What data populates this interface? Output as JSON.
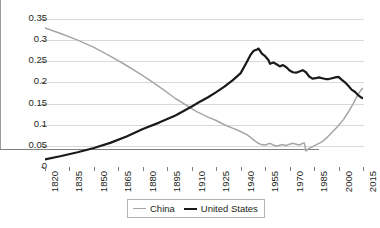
{
  "chart_data": {
    "type": "line",
    "title": "",
    "subtitle": "",
    "xlabel": "",
    "ylabel": "",
    "xlim": [
      1820,
      2015
    ],
    "ylim": [
      0,
      0.35
    ],
    "grid": true,
    "legend_position": "bottom",
    "ytick_labels": [
      "0.35",
      "0.3",
      "0.25",
      "0.2",
      "0.15",
      "0.1",
      "0.05",
      "0"
    ],
    "ytick_values": [
      0.35,
      0.3,
      0.25,
      0.2,
      0.15,
      0.1,
      0.05,
      0
    ],
    "xtick_labels": [
      "1820",
      "1835",
      "1850",
      "1865",
      "1880",
      "1895",
      "1910",
      "1925",
      "1940",
      "1955",
      "1970",
      "1985",
      "2000",
      "2015"
    ],
    "xtick_values": [
      1820,
      1835,
      1850,
      1865,
      1880,
      1895,
      1910,
      1925,
      1940,
      1955,
      1970,
      1985,
      2000,
      2015
    ],
    "series": [
      {
        "name": "China",
        "color": "#a6a6a6",
        "x": [
          1820,
          1830,
          1840,
          1850,
          1860,
          1870,
          1880,
          1890,
          1900,
          1910,
          1913,
          1920,
          1925,
          1930,
          1935,
          1940,
          1944,
          1946,
          1948,
          1950,
          1952,
          1955,
          1958,
          1960,
          1962,
          1965,
          1968,
          1970,
          1972,
          1974,
          1976,
          1978,
          1979,
          1980,
          1982,
          1985,
          1988,
          1990,
          1993,
          1995,
          1998,
          2000,
          2003,
          2006,
          2009,
          2012,
          2014,
          2016
        ],
        "y": [
          0.329,
          0.315,
          0.3,
          0.283,
          0.262,
          0.24,
          0.216,
          0.19,
          0.162,
          0.138,
          0.131,
          0.118,
          0.11,
          0.1,
          0.092,
          0.084,
          0.076,
          0.07,
          0.064,
          0.058,
          0.054,
          0.052,
          0.056,
          0.052,
          0.049,
          0.053,
          0.051,
          0.054,
          0.056,
          0.054,
          0.052,
          0.056,
          0.057,
          0.038,
          0.044,
          0.05,
          0.056,
          0.06,
          0.07,
          0.078,
          0.09,
          0.098,
          0.112,
          0.13,
          0.15,
          0.172,
          0.183,
          0.19
        ]
      },
      {
        "name": "United States",
        "color": "#1a1a1a",
        "x": [
          1820,
          1830,
          1840,
          1850,
          1860,
          1870,
          1880,
          1890,
          1900,
          1910,
          1913,
          1920,
          1925,
          1930,
          1935,
          1940,
          1944,
          1946,
          1948,
          1950,
          1951,
          1953,
          1955,
          1957,
          1958,
          1960,
          1962,
          1964,
          1966,
          1968,
          1970,
          1972,
          1974,
          1976,
          1978,
          1980,
          1982,
          1984,
          1986,
          1988,
          1990,
          1992,
          1994,
          1996,
          1998,
          2000,
          2002,
          2004,
          2006,
          2008,
          2010,
          2012,
          2014,
          2016
        ],
        "y": [
          0.018,
          0.026,
          0.035,
          0.045,
          0.057,
          0.072,
          0.09,
          0.105,
          0.122,
          0.143,
          0.15,
          0.165,
          0.177,
          0.19,
          0.205,
          0.222,
          0.25,
          0.265,
          0.275,
          0.278,
          0.28,
          0.268,
          0.262,
          0.253,
          0.244,
          0.247,
          0.243,
          0.238,
          0.241,
          0.236,
          0.228,
          0.224,
          0.223,
          0.226,
          0.229,
          0.224,
          0.214,
          0.209,
          0.21,
          0.212,
          0.21,
          0.208,
          0.208,
          0.21,
          0.212,
          0.213,
          0.206,
          0.2,
          0.192,
          0.183,
          0.178,
          0.17,
          0.164,
          0.162
        ]
      }
    ],
    "legend_entries": [
      {
        "label": "China",
        "color": "#a6a6a6"
      },
      {
        "label": "United States",
        "color": "#1a1a1a"
      }
    ],
    "annotations": []
  }
}
